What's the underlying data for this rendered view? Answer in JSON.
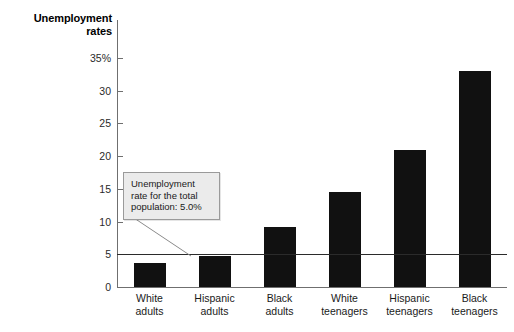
{
  "chart_data": {
    "type": "bar",
    "title": "Unemployment rates",
    "xlabel": "",
    "ylabel": "Unemployment rates",
    "categories": [
      "White adults",
      "Hispanic adults",
      "Black adults",
      "White teenagers",
      "Hispanic teenagers",
      "Black teenagers"
    ],
    "category_lines": [
      [
        "White",
        "adults"
      ],
      [
        "Hispanic",
        "adults"
      ],
      [
        "Black",
        "adults"
      ],
      [
        "White",
        "teenagers"
      ],
      [
        "Hispanic",
        "teenagers"
      ],
      [
        "Black",
        "teenagers"
      ]
    ],
    "values": [
      3.7,
      4.7,
      9.2,
      14.5,
      21.0,
      33.0
    ],
    "ylim": [
      0,
      35
    ],
    "yticks": [
      0,
      5,
      10,
      15,
      20,
      25,
      30,
      35
    ],
    "ytick_labels": [
      "0",
      "5",
      "10",
      "15",
      "20",
      "25",
      "30",
      "35%"
    ],
    "grid": false,
    "legend": false,
    "bar_color": "#111111",
    "axis_color": "#6f6f6f",
    "reference_line": {
      "value": 5.0,
      "color": "#2b2b2b",
      "label": "Unemployment rate for the total population: 5.0%"
    },
    "annotations": [
      {
        "text": "Unemployment rate for the total population: 5.0%",
        "lines": [
          "Unemployment",
          "rate for the total",
          "population: 5.0%"
        ],
        "target_value": 5.0
      }
    ]
  },
  "callout": {
    "line1": "Unemployment",
    "line2": "rate for the total",
    "line3": "population: 5.0%"
  }
}
